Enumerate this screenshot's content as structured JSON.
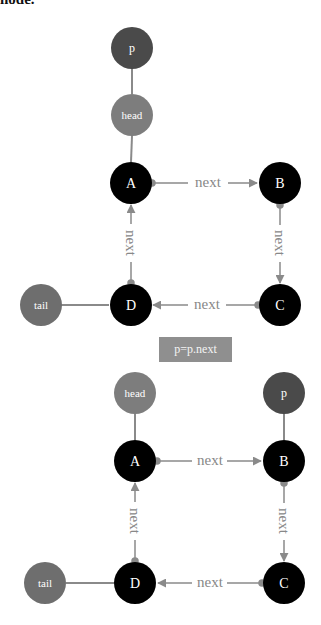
{
  "caption": "node.",
  "colors": {
    "node_black": "#000000",
    "pointer_p": "#4a4a4a",
    "pointer_head": "#7d7d7d",
    "pointer_tail": "#6e6e6e",
    "edge": "#8a8a8a",
    "op_box": "#8f8f8f"
  },
  "operation_label": "p=p.next",
  "diagrams": [
    {
      "name": "before",
      "nodes": [
        {
          "id": "p",
          "label": "p"
        },
        {
          "id": "head",
          "label": "head"
        },
        {
          "id": "A",
          "label": "A"
        },
        {
          "id": "B",
          "label": "B"
        },
        {
          "id": "C",
          "label": "C"
        },
        {
          "id": "D",
          "label": "D"
        },
        {
          "id": "tail",
          "label": "tail"
        }
      ],
      "edges": [
        {
          "from": "A",
          "to": "B",
          "label": "next"
        },
        {
          "from": "B",
          "to": "C",
          "label": "next"
        },
        {
          "from": "C",
          "to": "D",
          "label": "next"
        },
        {
          "from": "D",
          "to": "A",
          "label": "next"
        }
      ]
    },
    {
      "name": "after",
      "nodes": [
        {
          "id": "head",
          "label": "head"
        },
        {
          "id": "p",
          "label": "p"
        },
        {
          "id": "A",
          "label": "A"
        },
        {
          "id": "B",
          "label": "B"
        },
        {
          "id": "C",
          "label": "C"
        },
        {
          "id": "D",
          "label": "D"
        },
        {
          "id": "tail",
          "label": "tail"
        }
      ],
      "edges": [
        {
          "from": "A",
          "to": "B",
          "label": "next"
        },
        {
          "from": "B",
          "to": "C",
          "label": "next"
        },
        {
          "from": "C",
          "to": "D",
          "label": "next"
        },
        {
          "from": "D",
          "to": "A",
          "label": "next"
        }
      ]
    }
  ]
}
